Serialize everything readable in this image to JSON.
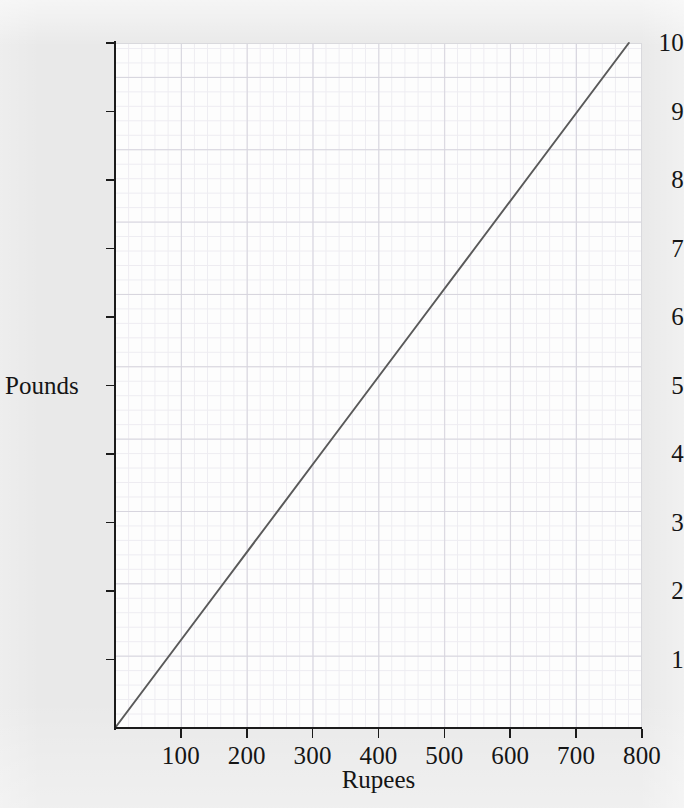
{
  "chart_data": {
    "type": "line",
    "title": "",
    "xlabel": "Rupees",
    "ylabel": "Pounds",
    "xlim": [
      0,
      800
    ],
    "ylim": [
      0,
      10
    ],
    "xticks": [
      100,
      200,
      300,
      400,
      500,
      600,
      700,
      800
    ],
    "yticks": [
      1,
      2,
      3,
      4,
      5,
      6,
      7,
      8,
      9,
      10
    ],
    "xtick_labels": [
      "100",
      "200",
      "300",
      "400",
      "500",
      "600",
      "700",
      "800"
    ],
    "ytick_labels": [
      "1",
      "2",
      "3",
      "4",
      "5",
      "6",
      "7",
      "8",
      "9",
      "10"
    ],
    "grid": true,
    "grid_minor": true,
    "legend": "none",
    "series": [
      {
        "name": "rupees-to-pounds-conversion",
        "color": "#5a5a5a",
        "line_width": 2,
        "x": [
          0,
          780
        ],
        "y": [
          0,
          10
        ],
        "points": [
          {
            "x": 0,
            "y": 0
          },
          {
            "x": 78,
            "y": 1
          },
          {
            "x": 156,
            "y": 2
          },
          {
            "x": 234,
            "y": 3
          },
          {
            "x": 312,
            "y": 4
          },
          {
            "x": 390,
            "y": 5
          },
          {
            "x": 468,
            "y": 6
          },
          {
            "x": 546,
            "y": 7
          },
          {
            "x": 624,
            "y": 8
          },
          {
            "x": 702,
            "y": 9
          },
          {
            "x": 780,
            "y": 10
          }
        ]
      }
    ]
  },
  "colors": {
    "page_background": "#e9e9e9",
    "plot_background": "#fdfdfd",
    "axis": "#1b1b1b",
    "line": "#5a5a5a",
    "grid_major": "#d6d4dd",
    "grid_minor": "#e9e7ee",
    "text": "#151515"
  }
}
